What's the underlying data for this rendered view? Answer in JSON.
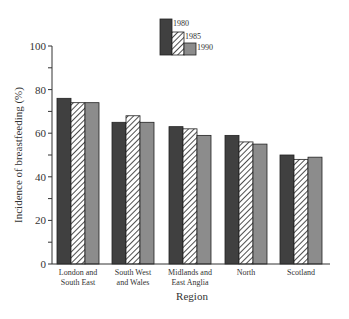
{
  "chart_data": {
    "type": "bar",
    "title": "",
    "xlabel": "Region",
    "ylabel": "Incidence of breastfeeding (%)",
    "ylim": [
      0,
      100
    ],
    "yticks": [
      0,
      20,
      40,
      60,
      80,
      100
    ],
    "grid": false,
    "legend_position": "top-center",
    "categories": [
      "London and South East",
      "South West and Wales",
      "Midlands and East Anglia",
      "North",
      "Scotland"
    ],
    "category_lines": [
      [
        "London and",
        "South East"
      ],
      [
        "South West",
        "and Wales"
      ],
      [
        "Midlands and",
        "East Anglia"
      ],
      [
        "North"
      ],
      [
        "Scotland"
      ]
    ],
    "series": [
      {
        "name": "1980",
        "values": [
          76,
          65,
          63,
          59,
          50
        ],
        "fill": "#404040",
        "pattern": "solid"
      },
      {
        "name": "1985",
        "values": [
          74,
          68,
          62,
          56,
          48
        ],
        "fill": "#ffffff",
        "pattern": "hatch"
      },
      {
        "name": "1990",
        "values": [
          74,
          65,
          59,
          55,
          49
        ],
        "fill": "#8c8c8c",
        "pattern": "solid"
      }
    ]
  }
}
